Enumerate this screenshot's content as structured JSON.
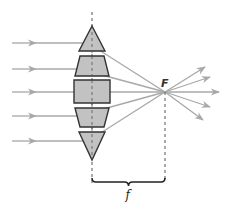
{
  "diagram": {
    "focal_point_label": "F",
    "focal_length_label": "f",
    "colors": {
      "ray": "#a8a8a8",
      "prism_fill": "#c2c2c2",
      "prism_stroke": "#333333",
      "axis_dash": "#555555",
      "brace": "#222222"
    },
    "incoming_rays": [
      {
        "y": 43,
        "hit_x": 88,
        "hit_y": 43
      },
      {
        "y": 69,
        "hit_x": 80,
        "hit_y": 69
      },
      {
        "y": 92,
        "hit_x": 74,
        "hit_y": 92
      },
      {
        "y": 116,
        "hit_x": 78,
        "hit_y": 116
      },
      {
        "y": 141,
        "hit_x": 88,
        "hit_y": 141
      }
    ],
    "prisms": [
      {
        "name": "top-triangle",
        "points": "92,26 105,51 79,51"
      },
      {
        "name": "upper-trapezoid",
        "points": "80,56 104,56 109,76 75,76"
      },
      {
        "name": "center-rectangle",
        "points": "74,80 110,80 110,103 74,103"
      },
      {
        "name": "lower-trapezoid",
        "points": "75,108 109,108 104,127 80,127"
      },
      {
        "name": "bottom-triangle",
        "points": "79,132 105,132 92,160"
      }
    ],
    "focal_point": {
      "x": 165,
      "y": 92
    },
    "outgoing_rays": [
      {
        "x2": 205,
        "y2": 67
      },
      {
        "x2": 210,
        "y2": 77
      },
      {
        "x2": 219,
        "y2": 92
      },
      {
        "x2": 210,
        "y2": 107
      },
      {
        "x2": 203,
        "y2": 120
      }
    ]
  }
}
